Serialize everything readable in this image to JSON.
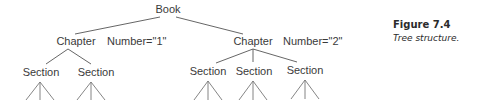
{
  "figure": {
    "number": "Figure 7.4",
    "title": "Tree structure."
  },
  "tree": {
    "root": "Book",
    "chapters": [
      {
        "label": "Chapter",
        "attribute": "Number=\"1\"",
        "sections": [
          "Section",
          "Section"
        ]
      },
      {
        "label": "Chapter",
        "attribute": "Number=\"2\"",
        "sections": [
          "Section",
          "Section",
          "Section"
        ]
      }
    ]
  }
}
